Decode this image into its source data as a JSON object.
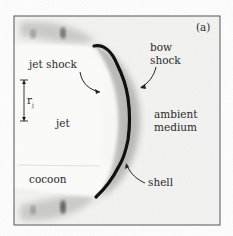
{
  "figure": {
    "panel_label": "(a)",
    "labels": {
      "bow_shock_line1": "bow",
      "bow_shock_line2": "shock",
      "jet_shock": "jet shock",
      "jet_radius_symbol": "r",
      "jet_radius_subscript": "j",
      "jet": "jet",
      "ambient_line1": "ambient",
      "ambient_line2": "medium",
      "cocoon": "cocoon",
      "shell": "shell"
    },
    "colors": {
      "background": "#ffffff",
      "frame": "#555555",
      "shell": "#111111",
      "haze": "#8a8a8a",
      "text": "#2a2a2a"
    }
  }
}
